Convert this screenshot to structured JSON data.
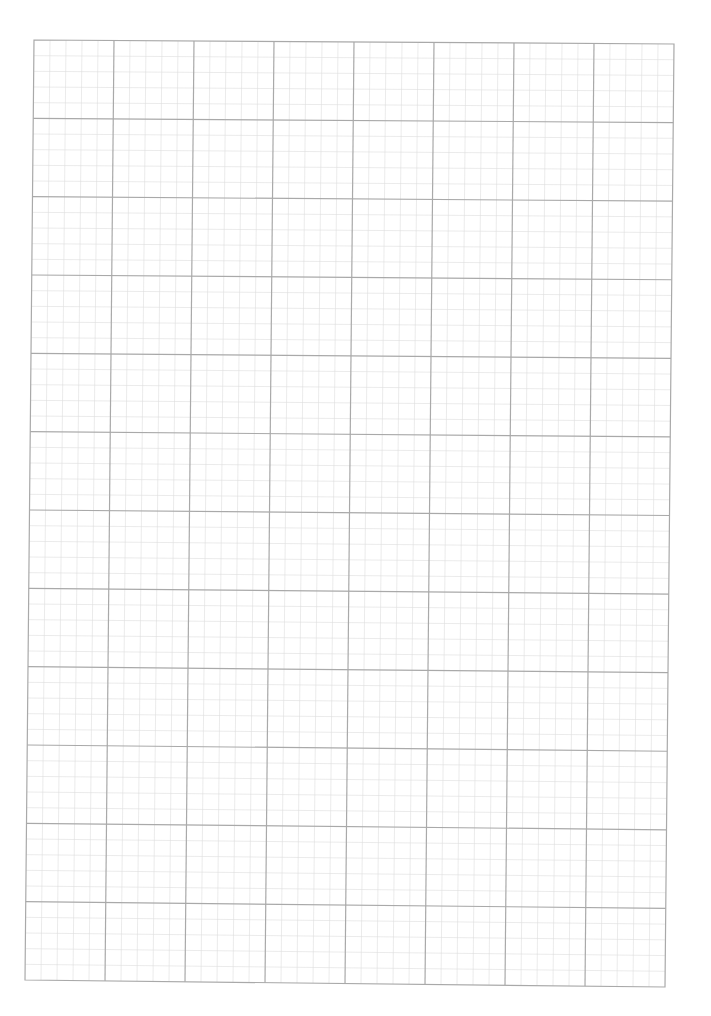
{
  "page": {
    "type": "graph-paper",
    "background": "#ffffff"
  },
  "grid": {
    "corners": {
      "top_left": [
        34,
        40
      ],
      "top_right": [
        674,
        44
      ],
      "bottom_left": [
        25,
        980
      ],
      "bottom_right": [
        665,
        987
      ]
    },
    "major_columns": 8,
    "major_rows": 12,
    "minor_per_major": 5,
    "major_color": "#a9a9a9",
    "minor_color": "#dedede",
    "border_color": "#a9a9a9",
    "major_width": 1.2,
    "minor_width": 0.6
  }
}
